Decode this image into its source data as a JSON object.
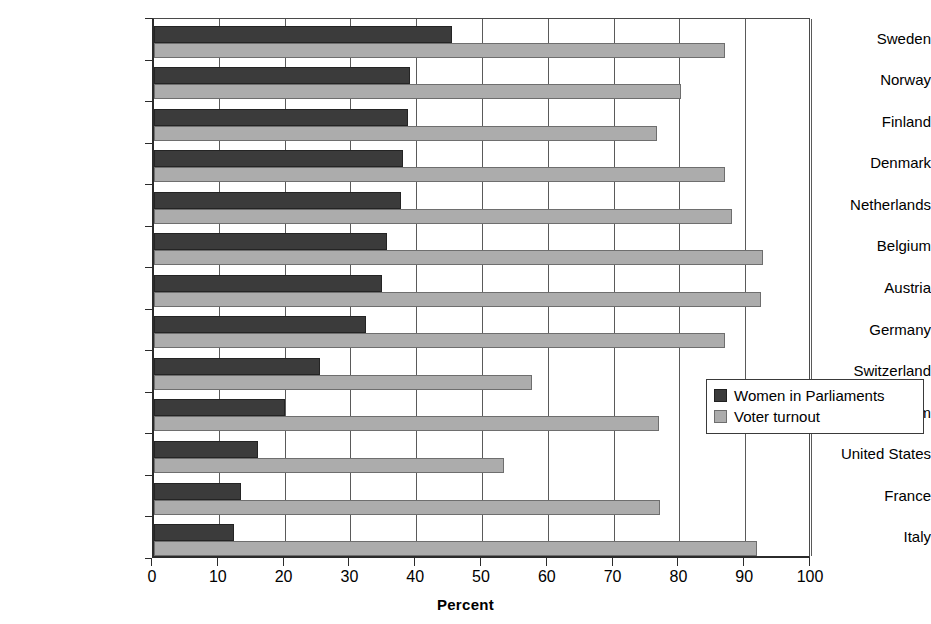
{
  "chart_data": {
    "type": "bar",
    "orientation": "horizontal",
    "title": "",
    "xlabel": "Percent",
    "ylabel": "",
    "xlim": [
      0,
      100
    ],
    "xticks": [
      0,
      10,
      20,
      30,
      40,
      50,
      60,
      70,
      80,
      90,
      100
    ],
    "grid": true,
    "grid_axis": "x",
    "legend_position": "center-right",
    "categories": [
      "Sweden",
      "Norway",
      "Finland",
      "Denmark",
      "Netherlands",
      "Belgium",
      "Austria",
      "Germany",
      "Switzerland",
      "United Kingdom",
      "United States",
      "France",
      "Italy"
    ],
    "series": [
      {
        "name": "Women in Parliaments",
        "color": "#3b3b3b",
        "values": [
          45.3,
          38.9,
          38.6,
          37.8,
          37.5,
          35.4,
          34.7,
          32.2,
          25.2,
          19.9,
          15.8,
          13.2,
          12.2
        ]
      },
      {
        "name": "Voter turnout",
        "color": "#acacac",
        "values": [
          86.8,
          80.1,
          76.4,
          86.8,
          87.8,
          92.6,
          92.2,
          86.8,
          57.4,
          76.7,
          53.2,
          76.9,
          91.6
        ]
      }
    ]
  },
  "axis": {
    "x_title": "Percent"
  },
  "legend": {
    "items": [
      {
        "label": "Women in Parliaments",
        "swatch": "dark"
      },
      {
        "label": "Voter turnout",
        "swatch": "light"
      }
    ]
  }
}
